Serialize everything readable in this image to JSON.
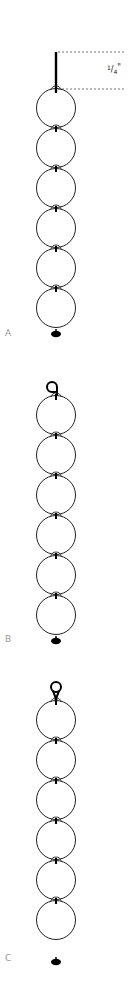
{
  "diagram": {
    "colors": {
      "stroke": "#222222",
      "label": "#9a9a9a",
      "dashed": "#555555",
      "fill": "#000000"
    },
    "dimension": {
      "label_num": "1",
      "label_den": "4",
      "label_unit": "\"",
      "text": "1/4\""
    },
    "variants": [
      {
        "id": "A",
        "label": "A",
        "top_ending": "straight-pin",
        "circles": 6,
        "bottom_ending": "crimp-bead"
      },
      {
        "id": "B",
        "label": "B",
        "top_ending": "simple-loop",
        "circles": 6,
        "bottom_ending": "crimp-bead"
      },
      {
        "id": "C",
        "label": "C",
        "top_ending": "wrapped-loop",
        "circles": 6,
        "bottom_ending": "crimp-bead"
      }
    ]
  }
}
